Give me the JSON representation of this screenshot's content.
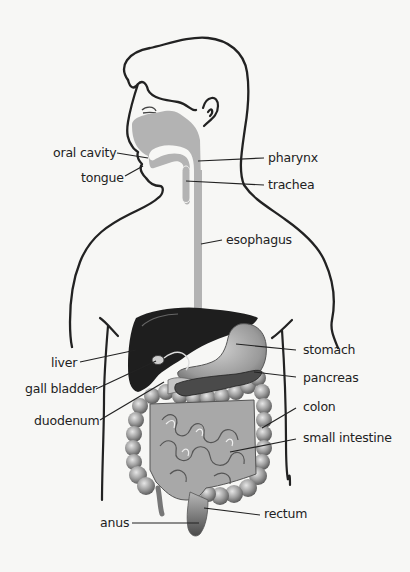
{
  "diagram": {
    "colors": {
      "background": "#f7f7f5",
      "outline": "#222222",
      "tract_gray": "#b3b3b3",
      "liver_dark": "#1e1e1e",
      "stomach_gray": "#9a9a9a",
      "intestine_gray": "#a8a8a8",
      "colon_gray": "#8e8e8e",
      "label_text": "#222222"
    },
    "labels": {
      "oral_cavity": "oral cavity",
      "tongue": "tongue",
      "pharynx": "pharynx",
      "trachea": "trachea",
      "esophagus": "esophagus",
      "liver": "liver",
      "gall_bladder": "gall bladder",
      "duodenum": "duodenum",
      "stomach": "stomach",
      "pancreas": "pancreas",
      "colon": "colon",
      "small_intestine": "small intestine",
      "rectum": "rectum",
      "anus": "anus"
    }
  }
}
